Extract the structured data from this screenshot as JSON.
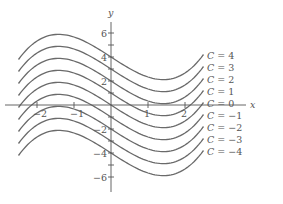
{
  "chart_data": {
    "type": "line",
    "title": "",
    "xlabel": "x",
    "ylabel": "y",
    "function": "y = x^3/3 - 2x + C",
    "x_range": [
      -2.5,
      2.5
    ],
    "xlim": [
      -2.9,
      3.6
    ],
    "ylim": [
      -7.5,
      8
    ],
    "grid": false,
    "legend_position": "right, inline curve labels",
    "x_ticks": [
      -2,
      -1,
      1,
      2
    ],
    "x_tick_labels": [
      "−2",
      "−1",
      "1",
      "2"
    ],
    "y_ticks": [
      -6,
      -5,
      -4,
      -3,
      -2,
      -1,
      1,
      2,
      3,
      4,
      5,
      6
    ],
    "y_tick_labels": [
      {
        "value": 6,
        "label": "6"
      },
      {
        "value": 4,
        "label": "4"
      },
      {
        "value": 2,
        "label": "2"
      },
      {
        "value": -2,
        "label": "−2"
      },
      {
        "value": -4,
        "label": "−4"
      },
      {
        "value": -6,
        "label": "−6"
      }
    ],
    "series": [
      {
        "name": "C = 4",
        "C": 4
      },
      {
        "name": "C = 3",
        "C": 3
      },
      {
        "name": "C = 2",
        "C": 2
      },
      {
        "name": "C = 1",
        "C": 1
      },
      {
        "name": "C = 0",
        "C": 0
      },
      {
        "name": "C = −1",
        "C": -1
      },
      {
        "name": "C = −2",
        "C": -2
      },
      {
        "name": "C = −3",
        "C": -3
      },
      {
        "name": "C = −4",
        "C": -4
      }
    ],
    "sample_points_C0": {
      "x": [
        -2.5,
        -2,
        -1.414,
        -1,
        0,
        1,
        1.414,
        2,
        2.5
      ],
      "y": [
        -0.21,
        1.33,
        1.89,
        1.67,
        0,
        -1.67,
        -1.89,
        -1.33,
        0.21
      ]
    }
  },
  "layout": {
    "origin_px": [
      111,
      105
    ],
    "px_per_unit_x": 37,
    "px_per_unit_y": 12,
    "x_axis_px": [
      5,
      246
    ],
    "y_axis_px": [
      22,
      192
    ],
    "label_x_px": 207
  },
  "colors": {
    "curve": "#6a6a6a",
    "axis": "#555555",
    "background": "#ffffff"
  }
}
